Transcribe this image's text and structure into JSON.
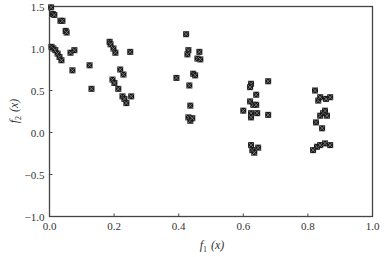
{
  "chart_data": {
    "type": "scatter",
    "title": "",
    "xlabel": "f1(x)",
    "ylabel": "f2(x)",
    "xlabel_main": "f",
    "xlabel_sub": "1",
    "xlabel_arg": "(x)",
    "ylabel_main": "f",
    "ylabel_sub": "2",
    "ylabel_arg": "(x)",
    "xlim": [
      0.0,
      1.0
    ],
    "ylim": [
      -1.0,
      1.5
    ],
    "xticks": [
      0.0,
      0.2,
      0.4,
      0.6,
      0.8,
      1.0
    ],
    "xtick_labels": [
      "0.0",
      "0.2",
      "0.4",
      "0.6",
      "0.8",
      "1.0"
    ],
    "yticks": [
      -1.0,
      -0.5,
      0.0,
      0.5,
      1.0,
      1.5
    ],
    "ytick_labels": [
      "−1.0",
      "−0.5",
      "0.0",
      "0.5",
      "1.0",
      "1.5"
    ],
    "grid": false,
    "legend": null,
    "marker_color": "#1a1a1a",
    "series": [
      {
        "name": "Pareto front",
        "points": [
          [
            0.005,
            1.49
          ],
          [
            0.01,
            1.41
          ],
          [
            0.015,
            1.4
          ],
          [
            0.034,
            1.33
          ],
          [
            0.04,
            1.33
          ],
          [
            0.05,
            1.21
          ],
          [
            0.053,
            1.19
          ],
          [
            0.006,
            1.02
          ],
          [
            0.012,
            1.0
          ],
          [
            0.018,
            0.98
          ],
          [
            0.025,
            0.94
          ],
          [
            0.031,
            0.9
          ],
          [
            0.037,
            0.86
          ],
          [
            0.065,
            0.95
          ],
          [
            0.077,
            0.98
          ],
          [
            0.071,
            0.74
          ],
          [
            0.124,
            0.8
          ],
          [
            0.13,
            0.52
          ],
          [
            0.186,
            1.08
          ],
          [
            0.189,
            1.05
          ],
          [
            0.198,
            1.0
          ],
          [
            0.204,
            0.95
          ],
          [
            0.25,
            0.96
          ],
          [
            0.219,
            0.75
          ],
          [
            0.229,
            0.69
          ],
          [
            0.195,
            0.63
          ],
          [
            0.201,
            0.59
          ],
          [
            0.213,
            0.52
          ],
          [
            0.226,
            0.43
          ],
          [
            0.232,
            0.4
          ],
          [
            0.238,
            0.35
          ],
          [
            0.253,
            0.43
          ],
          [
            0.423,
            1.17
          ],
          [
            0.43,
            0.98
          ],
          [
            0.427,
            0.93
          ],
          [
            0.464,
            0.96
          ],
          [
            0.458,
            0.88
          ],
          [
            0.467,
            0.87
          ],
          [
            0.393,
            0.65
          ],
          [
            0.445,
            0.7
          ],
          [
            0.451,
            0.68
          ],
          [
            0.433,
            0.56
          ],
          [
            0.436,
            0.32
          ],
          [
            0.43,
            0.18
          ],
          [
            0.436,
            0.14
          ],
          [
            0.442,
            0.17
          ],
          [
            0.624,
            0.58
          ],
          [
            0.621,
            0.54
          ],
          [
            0.677,
            0.61
          ],
          [
            0.64,
            0.45
          ],
          [
            0.621,
            0.37
          ],
          [
            0.631,
            0.33
          ],
          [
            0.64,
            0.33
          ],
          [
            0.6,
            0.26
          ],
          [
            0.624,
            0.23
          ],
          [
            0.624,
            0.18
          ],
          [
            0.643,
            0.23
          ],
          [
            0.677,
            0.21
          ],
          [
            0.624,
            -0.15
          ],
          [
            0.628,
            -0.21
          ],
          [
            0.634,
            -0.24
          ],
          [
            0.646,
            -0.18
          ],
          [
            0.822,
            0.5
          ],
          [
            0.832,
            0.38
          ],
          [
            0.838,
            0.42
          ],
          [
            0.856,
            0.4
          ],
          [
            0.869,
            0.42
          ],
          [
            0.838,
            0.2
          ],
          [
            0.847,
            0.23
          ],
          [
            0.853,
            0.26
          ],
          [
            0.859,
            0.2
          ],
          [
            0.825,
            0.12
          ],
          [
            0.844,
            0.05
          ],
          [
            0.828,
            -0.17
          ],
          [
            0.838,
            -0.15
          ],
          [
            0.853,
            -0.13
          ],
          [
            0.869,
            -0.15
          ],
          [
            0.816,
            -0.21
          ]
        ]
      }
    ]
  }
}
